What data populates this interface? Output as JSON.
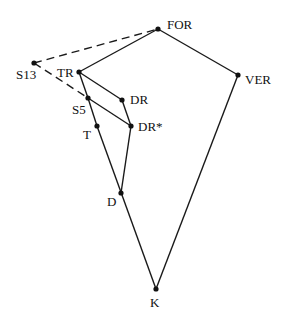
{
  "nodes": [
    {
      "id": "FOR",
      "label": "FOR",
      "x": 158,
      "y": 29,
      "lx": 167,
      "ly": 29
    },
    {
      "id": "VER",
      "label": "VER",
      "x": 238,
      "y": 75,
      "lx": 245,
      "ly": 84
    },
    {
      "id": "S13",
      "label": "S13",
      "x": 34,
      "y": 63,
      "lx": 16,
      "ly": 79
    },
    {
      "id": "TR",
      "label": "TR",
      "x": 79,
      "y": 72,
      "lx": 57,
      "ly": 77
    },
    {
      "id": "DR",
      "label": "DR",
      "x": 122,
      "y": 100,
      "lx": 130,
      "ly": 104
    },
    {
      "id": "S5",
      "label": "S5",
      "x": 88,
      "y": 98,
      "lx": 72,
      "ly": 114
    },
    {
      "id": "T",
      "label": "T",
      "x": 97,
      "y": 126,
      "lx": 83,
      "ly": 139
    },
    {
      "id": "DRstar",
      "label": "DR*",
      "x": 131,
      "y": 126,
      "lx": 138,
      "ly": 131
    },
    {
      "id": "D",
      "label": "D",
      "x": 121,
      "y": 193,
      "lx": 107,
      "ly": 206
    },
    {
      "id": "K",
      "label": "K",
      "x": 156,
      "y": 289,
      "lx": 150,
      "ly": 307
    }
  ],
  "edges": [
    {
      "from": "FOR",
      "to": "VER",
      "style": "solid"
    },
    {
      "from": "FOR",
      "to": "TR",
      "style": "solid"
    },
    {
      "from": "VER",
      "to": "K",
      "style": "solid"
    },
    {
      "from": "TR",
      "to": "DR",
      "style": "solid"
    },
    {
      "from": "TR",
      "to": "S5",
      "style": "solid"
    },
    {
      "from": "S5",
      "to": "T",
      "style": "solid"
    },
    {
      "from": "T",
      "to": "K",
      "style": "solid"
    },
    {
      "from": "S5",
      "to": "DRstar",
      "style": "solid"
    },
    {
      "from": "DR",
      "to": "DRstar",
      "style": "solid"
    },
    {
      "from": "DRstar",
      "to": "D",
      "style": "solid"
    },
    {
      "from": "S13",
      "to": "FOR",
      "style": "dashed"
    },
    {
      "from": "S13",
      "to": "S5",
      "style": "dashed"
    }
  ]
}
